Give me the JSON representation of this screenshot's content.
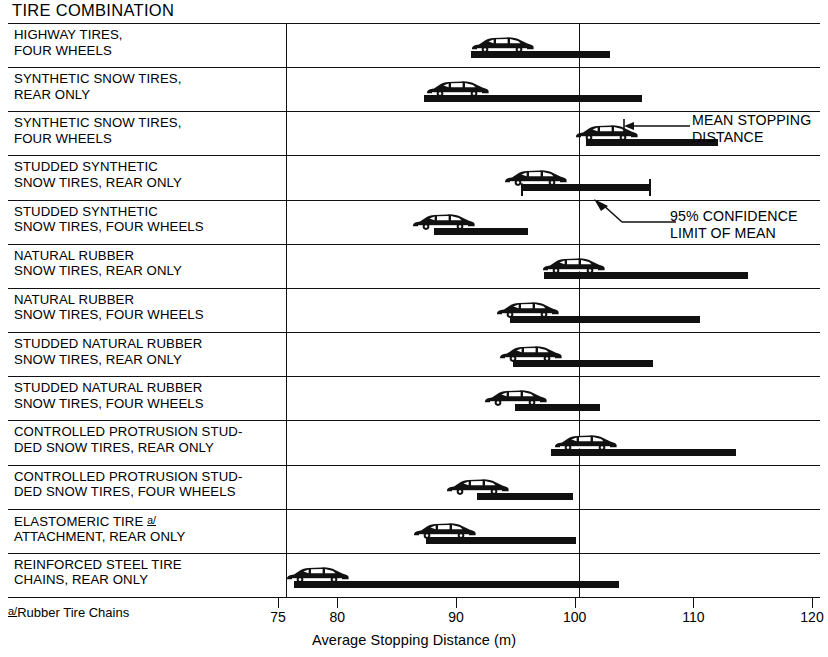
{
  "chart_title": "TIRE COMBINATION",
  "footnote": {
    "marker": "a/",
    "text": "Rubber Tire Chains"
  },
  "annotations": {
    "mean": "MEAN STOPPING\nDISTANCE",
    "confidence": "95% CONFIDENCE\nLIMIT OF MEAN"
  },
  "axis": {
    "title": "Average Stopping Distance (m)",
    "ticks": [
      75,
      80,
      90,
      100,
      110,
      120
    ],
    "tick_labels": [
      "75",
      "80",
      "90",
      "100",
      "110",
      "120"
    ],
    "reference_line": 100
  },
  "chart_data": {
    "type": "bar",
    "title": "TIRE COMBINATION",
    "xlabel": "Average Stopping Distance (m)",
    "ylabel": "Tire Combination",
    "xlim": [
      75,
      120
    ],
    "grid": false,
    "legend": "none",
    "orientation": "horizontal",
    "note": "Each horizontal bar is the 95% confidence limit of the mean; the car symbol marks the mean stopping distance.",
    "categories": [
      "HIGHWAY TIRES, FOUR WHEELS",
      "SYNTHETIC SNOW TIRES, REAR ONLY",
      "SYNTHETIC SNOW TIRES, FOUR WHEELS",
      "STUDDED SYNTHETIC SNOW TIRES, REAR ONLY",
      "STUDDED SYNTHETIC SNOW TIRES, FOUR WHEELS",
      "NATURAL RUBBER SNOW TIRES, REAR ONLY",
      "NATURAL RUBBER SNOW TIRES, FOUR WHEELS",
      "STUDDED NATURAL RUBBER SNOW TIRES, REAR ONLY",
      "STUDDED NATURAL RUBBER SNOW TIRES, FOUR WHEELS",
      "CONTROLLED PROTRUSION STUDDED SNOW TIRES, REAR ONLY",
      "CONTROLLED PROTRUSION STUDDED SNOW TIRES, FOUR WHEELS",
      "ELASTOMERIC TIRE a/ ATTACHMENT, REAR ONLY",
      "REINFORCED STEEL TIRE CHAINS, REAR ONLY"
    ],
    "ci_low": [
      90.6,
      86.6,
      100.3,
      94.8,
      87.5,
      96.7,
      93.9,
      94.1,
      94.3,
      97.3,
      91.1,
      86.8,
      75.7
    ],
    "ci_high": [
      102.3,
      105.0,
      111.4,
      105.8,
      95.4,
      113.9,
      109.9,
      105.9,
      101.5,
      112.9,
      99.2,
      99.4,
      103.1
    ],
    "means": [
      95.5,
      91.7,
      104.2,
      98.3,
      90.5,
      101.5,
      97.6,
      97.8,
      96.6,
      102.5,
      93.4,
      90.6,
      79.9
    ]
  },
  "rows": [
    {
      "label": "HIGHWAY TIRES,\nFOUR WHEELS"
    },
    {
      "label": "SYNTHETIC SNOW TIRES,\nREAR ONLY"
    },
    {
      "label": "SYNTHETIC SNOW TIRES,\nFOUR WHEELS"
    },
    {
      "label": "STUDDED SYNTHETIC\nSNOW TIRES, REAR ONLY"
    },
    {
      "label": "STUDDED SYNTHETIC\nSNOW TIRES, FOUR WHEELS"
    },
    {
      "label": "NATURAL RUBBER\nSNOW TIRES, REAR ONLY"
    },
    {
      "label": "NATURAL RUBBER\nSNOW TIRES, FOUR WHEELS"
    },
    {
      "label": "STUDDED NATURAL RUBBER\nSNOW TIRES, REAR ONLY"
    },
    {
      "label": "STUDDED NATURAL RUBBER\nSNOW TIRES, FOUR WHEELS"
    },
    {
      "label": "CONTROLLED PROTRUSION STUD-\nDED SNOW TIRES, REAR ONLY"
    },
    {
      "label": "CONTROLLED PROTRUSION STUD-\nDED SNOW TIRES, FOUR WHEELS"
    },
    {
      "label": "ELASTOMERIC TIRE \u0000\nATTACHMENT, REAR ONLY"
    },
    {
      "label": "REINFORCED STEEL TIRE\nCHAINS, REAR ONLY"
    }
  ]
}
